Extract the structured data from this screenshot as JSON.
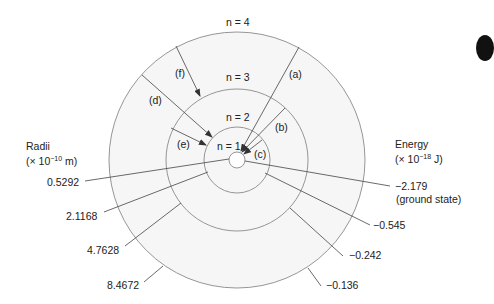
{
  "diagram": {
    "levels": [
      {
        "n": 1,
        "label": "n = 1",
        "radius": "0.5292",
        "energy": "−2.179",
        "energy_note": "(ground state)"
      },
      {
        "n": 2,
        "label": "n = 2",
        "radius": "2.1168",
        "energy": "−0.545"
      },
      {
        "n": 3,
        "label": "n = 3",
        "radius": "4.7628",
        "energy": "−0.242"
      },
      {
        "n": 4,
        "label": "n = 4",
        "radius": "8.4672",
        "energy": "−0.136"
      }
    ],
    "transitions": [
      {
        "label": "(a)",
        "from": 4,
        "to": 1
      },
      {
        "label": "(b)",
        "from": 3,
        "to": 1
      },
      {
        "label": "(c)",
        "from": 2,
        "to": 1
      },
      {
        "label": "(d)",
        "from": 4,
        "to": 2
      },
      {
        "label": "(e)",
        "from": 3,
        "to": 2
      },
      {
        "label": "(f)",
        "from": 4,
        "to": 3
      }
    ],
    "radii_axis": {
      "title": "Radii",
      "unit_prefix": "(× 10",
      "unit_exp": "−10",
      "unit_suffix": " m)"
    },
    "energy_axis": {
      "title": "Energy",
      "unit_prefix": "(× 10",
      "unit_exp": "−18",
      "unit_suffix": " J)"
    },
    "colors": {
      "ring": "#8a8a8a",
      "fill": "#f4f4f4",
      "line": "#333333"
    }
  }
}
